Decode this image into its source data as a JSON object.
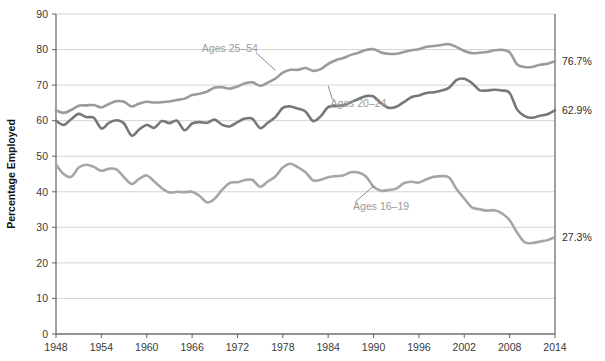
{
  "chart_data": {
    "type": "line",
    "title": "",
    "xlabel": "",
    "ylabel": "Percentage Employed",
    "xlim": [
      1948,
      2014
    ],
    "ylim": [
      0,
      90
    ],
    "ytick_step": 10,
    "xtick_step": 6,
    "grid": true,
    "legend_position": "inline-annotations",
    "yticks": [
      "0",
      "10",
      "20",
      "30",
      "40",
      "50",
      "60",
      "70",
      "80",
      "90"
    ],
    "xticks": [
      "1948",
      "1954",
      "1960",
      "1966",
      "1972",
      "1978",
      "1984",
      "1990",
      "1996",
      "2002",
      "2008",
      "2014"
    ],
    "colors": {
      "ages_25_54": "#9b9b9b",
      "ages_20_24": "#777777",
      "ages_16_19": "#a6a6a6",
      "grid": "#cfcfcf",
      "axis": "#6f6f6f",
      "annotation_text": "#9a9a9a",
      "tick_text": "#3a3a3a"
    },
    "x": [
      1948,
      1949,
      1950,
      1951,
      1952,
      1953,
      1954,
      1955,
      1956,
      1957,
      1958,
      1959,
      1960,
      1961,
      1962,
      1963,
      1964,
      1965,
      1966,
      1967,
      1968,
      1969,
      1970,
      1971,
      1972,
      1973,
      1974,
      1975,
      1976,
      1977,
      1978,
      1979,
      1980,
      1981,
      1982,
      1983,
      1984,
      1985,
      1986,
      1987,
      1988,
      1989,
      1990,
      1991,
      1992,
      1993,
      1994,
      1995,
      1996,
      1997,
      1998,
      1999,
      2000,
      2001,
      2002,
      2003,
      2004,
      2005,
      2006,
      2007,
      2008,
      2009,
      2010,
      2011,
      2012,
      2013,
      2014
    ],
    "series": [
      {
        "name": "Ages 25–54",
        "label": "Ages 25–54",
        "color": "#9b9b9b",
        "end_label": "76.7%",
        "end_value": 76.7,
        "label_x": 1971,
        "label_y": 80.3,
        "anchor_x": 1977,
        "anchor_y": 74.2,
        "values": [
          62.9,
          62.2,
          63.0,
          64.2,
          64.3,
          64.4,
          63.7,
          64.7,
          65.5,
          65.3,
          64.0,
          64.8,
          65.3,
          65.1,
          65.2,
          65.4,
          65.8,
          66.2,
          67.2,
          67.6,
          68.2,
          69.3,
          69.4,
          69.0,
          69.6,
          70.5,
          70.8,
          69.8,
          70.7,
          71.8,
          73.5,
          74.3,
          74.3,
          74.8,
          74.0,
          74.5,
          76.0,
          77.0,
          77.6,
          78.5,
          79.1,
          79.9,
          80.1,
          79.2,
          78.8,
          78.8,
          79.3,
          79.8,
          80.1,
          80.8,
          81.0,
          81.3,
          81.5,
          80.7,
          79.6,
          79.0,
          79.1,
          79.3,
          79.8,
          79.9,
          79.2,
          75.8,
          75.1,
          75.1,
          75.7,
          76.0,
          76.7
        ]
      },
      {
        "name": "Ages 20–24",
        "label": "Ages 20–24",
        "color": "#777777",
        "end_label": "62.9%",
        "end_value": 62.9,
        "label_x": 1988,
        "label_y": 64.8,
        "anchor_x": 1984,
        "anchor_y": 69.8,
        "values": [
          60.0,
          58.8,
          60.4,
          61.9,
          61.0,
          60.8,
          57.8,
          59.4,
          60.1,
          59.2,
          55.8,
          57.5,
          58.8,
          58.0,
          59.9,
          59.3,
          60.0,
          57.3,
          59.2,
          59.6,
          59.4,
          60.3,
          58.8,
          58.4,
          59.6,
          60.6,
          60.5,
          57.9,
          59.4,
          61.0,
          63.6,
          64.0,
          63.4,
          62.6,
          59.9,
          61.2,
          63.8,
          64.1,
          64.3,
          65.2,
          66.1,
          66.9,
          66.8,
          64.9,
          63.6,
          63.9,
          65.2,
          66.6,
          67.1,
          67.8,
          68.0,
          68.5,
          69.3,
          71.5,
          71.8,
          70.6,
          68.6,
          68.5,
          68.7,
          68.5,
          67.8,
          63.1,
          61.3,
          60.8,
          61.4,
          61.8,
          62.9
        ]
      },
      {
        "name": "Ages 16–19",
        "label": "Ages 16–19",
        "color": "#a6a6a6",
        "end_label": "27.3%",
        "end_value": 27.3,
        "label_x": 1991,
        "label_y": 36.0,
        "anchor_x": 1990,
        "anchor_y": 41.6,
        "values": [
          47.7,
          45.0,
          44.2,
          46.8,
          47.6,
          47.0,
          45.9,
          46.5,
          46.3,
          44.1,
          42.2,
          43.6,
          44.6,
          42.9,
          41.0,
          39.8,
          40.0,
          39.9,
          40.0,
          38.8,
          37.0,
          38.1,
          40.6,
          42.5,
          42.7,
          43.3,
          43.3,
          41.4,
          42.9,
          44.3,
          46.8,
          47.9,
          46.9,
          45.5,
          43.2,
          43.4,
          44.1,
          44.4,
          44.6,
          45.5,
          45.4,
          44.3,
          41.4,
          40.3,
          40.5,
          40.9,
          42.4,
          42.8,
          42.6,
          43.5,
          44.2,
          44.4,
          44.0,
          40.7,
          38.1,
          35.6,
          35.1,
          34.7,
          34.8,
          33.9,
          32.0,
          28.5,
          25.8,
          25.6,
          26.0,
          26.4,
          27.3
        ]
      }
    ]
  },
  "axis": {
    "y_title": "Percentage Employed"
  }
}
